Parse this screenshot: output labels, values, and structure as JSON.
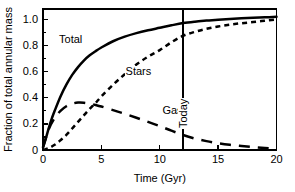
{
  "chart_data": {
    "type": "line",
    "title": "",
    "xlabel": "Time (Gyr)",
    "ylabel": "Fraction of total annular mass",
    "xlim": [
      0,
      20
    ],
    "ylim": [
      0,
      1.08
    ],
    "xticks": [
      "0",
      "5",
      "10",
      "15",
      "20"
    ],
    "xtick_values": [
      0,
      5,
      10,
      15,
      20
    ],
    "yticks": [
      "0",
      "0.2",
      "0.4",
      "0.6",
      "0.8",
      "1.0"
    ],
    "ytick_values": [
      0,
      0.2,
      0.4,
      0.6,
      0.8,
      1.0
    ],
    "grid": false,
    "legend": "inline-curve-labels",
    "annotations": [
      {
        "text": "Today",
        "x": 12,
        "orientation": "vertical",
        "type": "vertical-line-marker"
      }
    ],
    "series": [
      {
        "name": "Total",
        "style": "solid",
        "label_position": {
          "x": 2.4,
          "y": 0.845
        },
        "x": [
          0,
          0.25,
          0.5,
          0.75,
          1,
          1.5,
          2,
          2.5,
          3,
          3.5,
          4,
          4.5,
          5,
          6,
          7,
          8,
          9,
          10,
          11,
          12,
          13,
          14,
          15,
          16,
          17,
          18,
          19,
          20
        ],
        "y": [
          0.02,
          0.09,
          0.17,
          0.24,
          0.3,
          0.41,
          0.5,
          0.575,
          0.635,
          0.685,
          0.725,
          0.757,
          0.785,
          0.833,
          0.868,
          0.895,
          0.917,
          0.936,
          0.955,
          0.972,
          0.983,
          0.991,
          0.998,
          1.004,
          1.009,
          1.013,
          1.016,
          1.02
        ]
      },
      {
        "name": "Stars",
        "style": "dashed-short",
        "label_position": {
          "x": 8.1,
          "y": 0.6
        },
        "x": [
          0,
          0.5,
          1,
          1.5,
          2,
          2.5,
          3,
          3.5,
          4,
          4.5,
          5,
          6,
          7,
          8,
          9,
          10,
          11,
          12,
          13,
          14,
          15,
          16,
          17,
          18,
          19,
          20
        ],
        "y": [
          0.0,
          0.015,
          0.04,
          0.075,
          0.115,
          0.165,
          0.215,
          0.265,
          0.315,
          0.36,
          0.41,
          0.5,
          0.58,
          0.655,
          0.715,
          0.765,
          0.825,
          0.875,
          0.905,
          0.928,
          0.946,
          0.96,
          0.971,
          0.98,
          0.99,
          1.0
        ]
      },
      {
        "name": "Gas",
        "style": "dashed-long",
        "label_position": {
          "x": 11.0,
          "y": 0.295
        },
        "x": [
          0,
          0.5,
          1,
          1.5,
          2,
          2.5,
          3,
          3.5,
          4,
          4.5,
          5,
          6,
          7,
          8,
          9,
          10,
          11,
          12,
          13,
          14,
          15,
          16,
          17,
          18,
          19,
          20
        ],
        "y": [
          0.02,
          0.16,
          0.245,
          0.3,
          0.335,
          0.355,
          0.363,
          0.362,
          0.355,
          0.345,
          0.333,
          0.305,
          0.277,
          0.247,
          0.215,
          0.183,
          0.148,
          0.115,
          0.088,
          0.068,
          0.052,
          0.04,
          0.031,
          0.023,
          0.015,
          0.008
        ]
      }
    ]
  },
  "figure": {
    "background_color": "#ffffff",
    "axis_color": "#000000"
  }
}
